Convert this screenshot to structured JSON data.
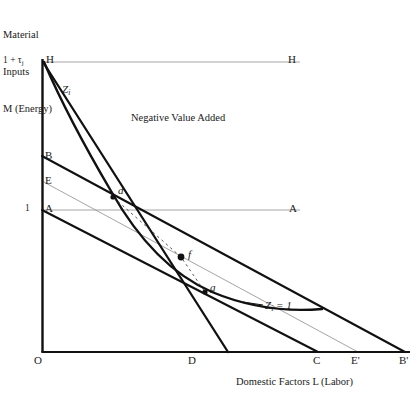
{
  "figure": {
    "axes": {
      "y_title_lines": [
        "Material",
        "Inputs",
        "M (Energy)"
      ],
      "y_title_text": "Material\nInputs\nM (Energy)",
      "x_title": "Domestic Factors L (Labor)",
      "y_ticks": [
        {
          "name": "top",
          "label": "1 + τj",
          "label_main": "1 + τ",
          "label_sub": "j",
          "value": 1.45,
          "y_px": 62
        },
        {
          "name": "unity",
          "label": "1",
          "value": 1.0,
          "y_px": 210
        }
      ],
      "x_ticks": [
        {
          "label": "O",
          "x_px": 42
        },
        {
          "label": "D",
          "x_px": 192
        },
        {
          "label": "C",
          "x_px": 318
        },
        {
          "label": "E'",
          "x_px": 358
        },
        {
          "label": "B'",
          "x_px": 405
        }
      ]
    },
    "point_labels": {
      "H_left": "H",
      "H_right": "H",
      "A_left": "A",
      "A_right": "A",
      "B": "B",
      "E": "E",
      "d": "d",
      "f": "f",
      "g": "g"
    },
    "curve_labels": {
      "isoquant_top": "Zᵢ",
      "isoquant_top_main": "Z",
      "isoquant_top_sub": "i",
      "isoquant_value": "Zᵢ = 1",
      "isoquant_value_main": "Z",
      "isoquant_value_sub": "i",
      "isoquant_value_tail": " = 1"
    },
    "region_labels": {
      "negative_value_added": "Negative Value Added"
    },
    "colors": {
      "ink": "#1a1a1a",
      "thick_line": "#111111",
      "thin_line": "#9a9a9a",
      "background": "#ffffff",
      "dotted_line": "#4a4a4a"
    },
    "geometry": {
      "origin": {
        "x": 42,
        "y": 352
      },
      "y_axis_top": {
        "x": 42,
        "y": 62
      },
      "x_axis_right": {
        "x": 410,
        "y": 352
      },
      "H_horizontal": {
        "x1": 42,
        "y1": 62,
        "x2": 300,
        "y2": 62
      },
      "A_horizontal": {
        "x1": 42,
        "y1": 210,
        "x2": 300,
        "y2": 210
      },
      "line_H_D": {
        "x1": 42,
        "y1": 62,
        "x2": 228,
        "y2": 352
      },
      "line_B_Bprime": {
        "x1": 42,
        "y1": 156,
        "x2": 405,
        "y2": 352
      },
      "line_E_Eprime": {
        "x1": 42,
        "y1": 181,
        "x2": 358,
        "y2": 352
      },
      "line_A_C": {
        "x1": 42,
        "y1": 210,
        "x2": 318,
        "y2": 352
      },
      "isoquant": "M 44 62 C 66 112 92 156 112 192 C 136 236 170 276 214 294 C 252 308 286 312 320 310",
      "points": [
        {
          "label": "d",
          "x": 113,
          "y": 197,
          "marker": "small"
        },
        {
          "label": "f",
          "x": 181,
          "y": 257,
          "marker": "large"
        },
        {
          "label": "g",
          "x": 205,
          "y": 292,
          "marker": "small"
        }
      ],
      "dotted_path": "M 113 197 L 181 257 L 205 292"
    }
  }
}
